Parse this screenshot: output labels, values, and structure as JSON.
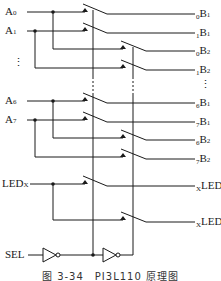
{
  "diagram": {
    "inputs": [
      {
        "name": "A",
        "sub": "0"
      },
      {
        "name": "A",
        "sub": "1"
      },
      {
        "name": "A",
        "sub": "6"
      },
      {
        "name": "A",
        "sub": "7"
      },
      {
        "name": "LED",
        "sub": "X"
      }
    ],
    "outputs": [
      {
        "pre": "0",
        "name": "B",
        "sub": "1"
      },
      {
        "pre": "1",
        "name": "B",
        "sub": "1"
      },
      {
        "pre": "0",
        "name": "B",
        "sub": "2"
      },
      {
        "pre": "1",
        "name": "B",
        "sub": "2"
      },
      {
        "pre": "6",
        "name": "B",
        "sub": "1"
      },
      {
        "pre": "7",
        "name": "B",
        "sub": "1"
      },
      {
        "pre": "6",
        "name": "B",
        "sub": "2"
      },
      {
        "pre": "7",
        "name": "B",
        "sub": "2"
      },
      {
        "pre": "X",
        "name": "LED",
        "sub": "1"
      },
      {
        "pre": "X",
        "name": "LED",
        "sub": "2"
      }
    ],
    "ellipsis": "⋮",
    "control": "SEL",
    "caption": "图 3-34　PI3L110 原理图"
  }
}
